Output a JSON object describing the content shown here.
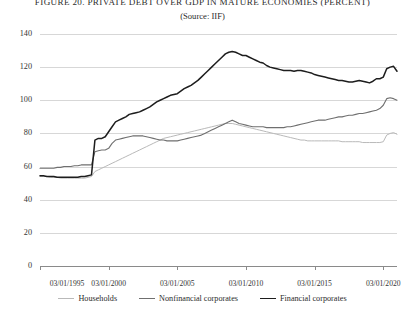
{
  "figure": {
    "title": "FIGURE 20. PRIVATE DEBT OVER GDP IN MATURE  ECONOMIES (PERCENT)",
    "subtitle": "(Source: IIF)"
  },
  "chart_data": {
    "type": "line",
    "title": "FIGURE 20. PRIVATE DEBT OVER GDP IN MATURE  ECONOMIES (PERCENT)",
    "subtitle": "(Source: IIF)",
    "xlabel": "",
    "ylabel": "",
    "grid": true,
    "legend_position": "bottom",
    "ylim": [
      0,
      140
    ],
    "yticks": [
      0,
      20,
      40,
      60,
      80,
      100,
      120,
      140
    ],
    "ytick_labels": [
      "0",
      "20",
      "40",
      "60",
      "80",
      "100",
      "120",
      "140"
    ],
    "xlim": [
      "03/01/1995",
      "03/01/2021"
    ],
    "xticks": [
      "03/01/1995",
      "03/01/2000",
      "03/01/2005",
      "03/01/2010",
      "03/01/2015",
      "03/01/2020"
    ],
    "xtick_labels": [
      "03/01/1995",
      "03/01/2000",
      "03/01/2005",
      "03/01/2010",
      "03/01/2015",
      "03/01/2020"
    ],
    "x": [
      1995.17,
      1995.42,
      1995.67,
      1995.92,
      1996.17,
      1996.42,
      1996.67,
      1996.92,
      1997.17,
      1997.42,
      1997.67,
      1997.92,
      1998.17,
      1998.42,
      1998.67,
      1998.92,
      1999.17,
      1999.42,
      1999.67,
      1999.92,
      2000.17,
      2000.42,
      2000.67,
      2000.92,
      2001.17,
      2001.42,
      2001.67,
      2001.92,
      2002.17,
      2002.42,
      2002.67,
      2002.92,
      2003.17,
      2003.42,
      2003.67,
      2003.92,
      2004.17,
      2004.42,
      2004.67,
      2004.92,
      2005.17,
      2005.42,
      2005.67,
      2005.92,
      2006.17,
      2006.42,
      2006.67,
      2006.92,
      2007.17,
      2007.42,
      2007.67,
      2007.92,
      2008.17,
      2008.42,
      2008.67,
      2008.92,
      2009.17,
      2009.42,
      2009.67,
      2009.92,
      2010.17,
      2010.42,
      2010.67,
      2010.92,
      2011.17,
      2011.42,
      2011.67,
      2011.92,
      2012.17,
      2012.42,
      2012.67,
      2012.92,
      2013.17,
      2013.42,
      2013.67,
      2013.92,
      2014.17,
      2014.42,
      2014.67,
      2014.92,
      2015.17,
      2015.42,
      2015.67,
      2015.92,
      2016.17,
      2016.42,
      2016.67,
      2016.92,
      2017.17,
      2017.42,
      2017.67,
      2017.92,
      2018.17,
      2018.42,
      2018.67,
      2018.92,
      2019.17,
      2019.42,
      2019.67,
      2019.92,
      2020.17,
      2020.42,
      2020.67,
      2020.92,
      2021.17
    ],
    "series": [
      {
        "name": "Households",
        "color": "#b9b9b9",
        "values": [
          54,
          54,
          54,
          53.5,
          53.5,
          53.5,
          53,
          53,
          53,
          53,
          53,
          53,
          53,
          53,
          53.5,
          54,
          57,
          58,
          59,
          60,
          61,
          62,
          63,
          64,
          65,
          66,
          67,
          68,
          69,
          70,
          71,
          72,
          73,
          74,
          75,
          76,
          77,
          77.5,
          78,
          78.5,
          79,
          79.5,
          80,
          80.5,
          81,
          81.5,
          82,
          82.5,
          83,
          83.5,
          84,
          84.5,
          85,
          85.5,
          86,
          86,
          86,
          85.5,
          85,
          84.5,
          84,
          83.5,
          83,
          82.5,
          82,
          81.5,
          81,
          80.5,
          80,
          79.5,
          79,
          78.5,
          78,
          77.5,
          77,
          76.5,
          76,
          76,
          75.5,
          75.5,
          75.5,
          75.5,
          75.5,
          75.5,
          75.5,
          75.5,
          75.5,
          75.5,
          75,
          75,
          75,
          75,
          75,
          75,
          74.5,
          74.5,
          74.5,
          74.5,
          74.5,
          74.5,
          75,
          79,
          80,
          80.5,
          79.5
        ]
      },
      {
        "name": "Nonfinancial corporates",
        "color": "#6f6f6f",
        "values": [
          59,
          59,
          59,
          59,
          59,
          59.5,
          59.5,
          60,
          60,
          60,
          60.5,
          60.5,
          61,
          61,
          61,
          61,
          69,
          69.5,
          70,
          70,
          71,
          74,
          76,
          76.5,
          77,
          77.5,
          78,
          78.5,
          78.5,
          78.5,
          78.5,
          78,
          77.5,
          77,
          76.5,
          76,
          76,
          75.5,
          75.5,
          75.5,
          75.5,
          76,
          76.5,
          77,
          77.5,
          78,
          78.5,
          79,
          80,
          81,
          82,
          83,
          84,
          85,
          86,
          87,
          88,
          87,
          86,
          85.5,
          85,
          84.5,
          84,
          84,
          84,
          84,
          83.5,
          83.5,
          83.5,
          83.5,
          83.5,
          83.5,
          84,
          84,
          84.5,
          85,
          85.5,
          86,
          86.5,
          87,
          87.5,
          88,
          88,
          88,
          88.5,
          89,
          89.5,
          90,
          90,
          90.5,
          91,
          91,
          91.5,
          92,
          92,
          92.5,
          93,
          93.5,
          94,
          95,
          97,
          101,
          101.5,
          101,
          100
        ]
      },
      {
        "name": "Financial corporates",
        "color": "#1d1d1d",
        "values": [
          54.5,
          54.5,
          54,
          54,
          54,
          53.5,
          53.5,
          53.5,
          53.5,
          53.5,
          53.5,
          53.5,
          54,
          54,
          54.5,
          55,
          76,
          77,
          77,
          78,
          81,
          84,
          87,
          88,
          89,
          90,
          91.5,
          92,
          92.5,
          93,
          94,
          95,
          96,
          97.5,
          99,
          100,
          101,
          102,
          103,
          103.5,
          104,
          105.5,
          107,
          108,
          109,
          110.5,
          112,
          114,
          116,
          118,
          120,
          122,
          124,
          126,
          128,
          129,
          129.5,
          129,
          128,
          127,
          127,
          126,
          125,
          124,
          123,
          122.5,
          121,
          120,
          119.5,
          119,
          118.5,
          118,
          118,
          118,
          117.5,
          118,
          118,
          117.5,
          117,
          116.5,
          115.5,
          115,
          114.5,
          114,
          113.5,
          113,
          112.5,
          112,
          112,
          111.5,
          111,
          111,
          111.5,
          112,
          111.5,
          111,
          110.5,
          111.5,
          113,
          113,
          114,
          119,
          120,
          120.5,
          117.5
        ]
      }
    ]
  },
  "legend": {
    "items": [
      {
        "label": "Households",
        "color": "#b9b9b9"
      },
      {
        "label": "Nonfinancial corporates",
        "color": "#6f6f6f"
      },
      {
        "label": "Financial corporates",
        "color": "#1d1d1d"
      }
    ]
  }
}
